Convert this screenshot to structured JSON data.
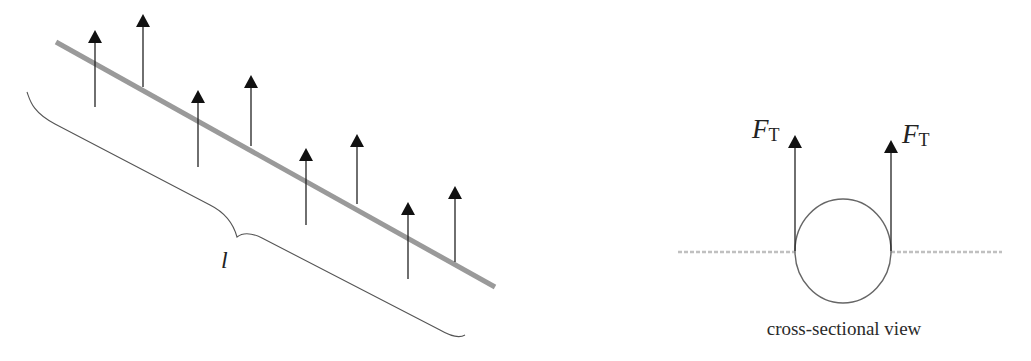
{
  "figure": {
    "left_panel": {
      "description": "Long rod lying on surface with upward surface-tension forces along its length",
      "rod": {
        "x1": 56,
        "y1": 42,
        "x2": 495,
        "y2": 287,
        "color": "#9a9a9a",
        "width": 5
      },
      "arrows": [
        {
          "x": 95,
          "top": 30,
          "bottom": 107
        },
        {
          "x": 143,
          "top": 14,
          "bottom": 87
        },
        {
          "x": 198,
          "top": 90,
          "bottom": 167
        },
        {
          "x": 251,
          "top": 75,
          "bottom": 146
        },
        {
          "x": 306,
          "top": 148,
          "bottom": 225
        },
        {
          "x": 357,
          "top": 134,
          "bottom": 204
        },
        {
          "x": 408,
          "top": 202,
          "bottom": 279
        },
        {
          "x": 455,
          "top": 186,
          "bottom": 262
        }
      ],
      "brace": {
        "start": [
          27,
          92
        ],
        "cusp": [
          237,
          237
        ],
        "end": [
          465,
          337
        ]
      },
      "length_label": "l"
    },
    "right_panel": {
      "circle": {
        "cx": 843,
        "cy": 251,
        "rx": 48,
        "ry": 52
      },
      "surface_line": {
        "y": 252,
        "x_left": 678,
        "x_right": 1002
      },
      "force_left": {
        "x": 795,
        "top": 135,
        "bottom": 251,
        "label_main": "F",
        "label_sub": "T"
      },
      "force_right": {
        "x": 891,
        "top": 140,
        "bottom": 251,
        "label_main": "F",
        "label_sub": "T"
      },
      "caption": "cross-sectional view"
    },
    "colors": {
      "arrow": "#222222",
      "brace": "#555555",
      "circle": "#666666",
      "surface": "#b5b5b5",
      "text": "#222222"
    }
  }
}
